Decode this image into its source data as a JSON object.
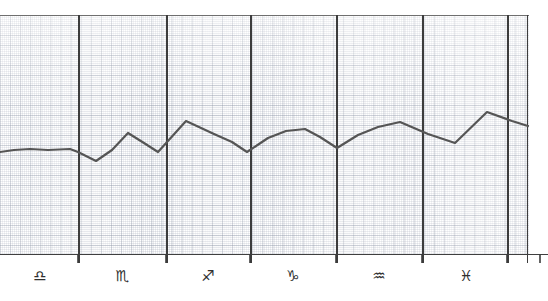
{
  "chart_data": {
    "type": "line",
    "title": "",
    "xlabel": "",
    "ylabel": "",
    "grid": true,
    "legend": "none",
    "background": "#ffffff",
    "line_color": "#555555",
    "grid_color": "#7882964D",
    "axis_color": "#3f3f3f",
    "xlim": [
      0,
      529
    ],
    "ylim": [
      0,
      240
    ],
    "axis_baseline_y": 254,
    "plot_top_y": 15,
    "categories": [
      "Libra",
      "Scorpio",
      "Sagittarius",
      "Capricorn",
      "Aquarius",
      "Pisces"
    ],
    "category_symbols": [
      "♎",
      "♏",
      "♐",
      "♑",
      "♒",
      "♓"
    ],
    "category_label_x": [
      40,
      122,
      208,
      293,
      379,
      466
    ],
    "divider_x": [
      78,
      166,
      250,
      336,
      422,
      507
    ],
    "points": [
      {
        "x": 0,
        "y": 152
      },
      {
        "x": 14,
        "y": 150
      },
      {
        "x": 30,
        "y": 149
      },
      {
        "x": 48,
        "y": 150
      },
      {
        "x": 70,
        "y": 149
      },
      {
        "x": 78,
        "y": 152
      },
      {
        "x": 96,
        "y": 161
      },
      {
        "x": 112,
        "y": 150
      },
      {
        "x": 128,
        "y": 133
      },
      {
        "x": 144,
        "y": 143
      },
      {
        "x": 158,
        "y": 152
      },
      {
        "x": 186,
        "y": 121
      },
      {
        "x": 214,
        "y": 134
      },
      {
        "x": 232,
        "y": 142
      },
      {
        "x": 247,
        "y": 152
      },
      {
        "x": 268,
        "y": 138
      },
      {
        "x": 286,
        "y": 131
      },
      {
        "x": 305,
        "y": 129
      },
      {
        "x": 320,
        "y": 137
      },
      {
        "x": 337,
        "y": 148
      },
      {
        "x": 358,
        "y": 135
      },
      {
        "x": 378,
        "y": 127
      },
      {
        "x": 400,
        "y": 122
      },
      {
        "x": 428,
        "y": 134
      },
      {
        "x": 455,
        "y": 143
      },
      {
        "x": 487,
        "y": 112
      },
      {
        "x": 512,
        "y": 121
      },
      {
        "x": 528,
        "y": 126
      }
    ],
    "series_name": "curve",
    "line_width": 2.2
  },
  "axis": {
    "tick_length": 9,
    "tick_color": "#3c3c3c"
  }
}
